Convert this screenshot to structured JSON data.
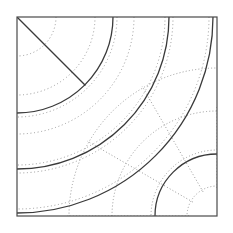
{
  "figure": {
    "title": "Concentric arc geometric construction",
    "background_color": "#ffffff",
    "frame": {
      "name": "bounding-square",
      "x": 17,
      "y": 17,
      "width": 200,
      "height": 199,
      "stroke": "#4a4a4a",
      "stroke_width": 1.2,
      "fill": "none"
    },
    "colors": {
      "solid_stroke": "#3a3a3a",
      "dotted_stroke": "#9a9a9a",
      "frame_stroke": "#4a4a4a"
    },
    "stroke_widths": {
      "solid": 1.3,
      "dotted": 1.0,
      "frame": 1.2
    },
    "dash_patterns": {
      "dotted": "1,2.6",
      "dotted_fine": "1,2.2"
    },
    "centers": [
      {
        "name": "top-left-center",
        "x": 17,
        "y": 17
      },
      {
        "name": "bottom-right-center",
        "x": 217,
        "y": 216
      }
    ],
    "diagonal": {
      "name": "corner-diagonal",
      "x1": 17,
      "y1": 17,
      "x2": 85,
      "y2": 85,
      "stroke": "#3a3a3a",
      "stroke_width": 1.3,
      "angle_degrees": 45
    },
    "solid_arcs": [
      {
        "name": "solid-arc-outer",
        "cx": 17,
        "cy": 17,
        "r": 196,
        "stroke": "#3a3a3a"
      },
      {
        "name": "solid-arc-middle",
        "cx": 17,
        "cy": 17,
        "r": 152,
        "stroke": "#3a3a3a"
      },
      {
        "name": "solid-arc-inner",
        "cx": 17,
        "cy": 17,
        "r": 96,
        "stroke": "#3a3a3a"
      }
    ],
    "solid_arcs_bottom_right": [
      {
        "name": "solid-arc-br",
        "cx": 217,
        "cy": 216,
        "r": 62,
        "stroke": "#3a3a3a"
      }
    ],
    "dotted_arcs_top_left": [
      {
        "name": "dotted-arc-tl-1",
        "cx": 17,
        "cy": 17,
        "r": 39
      },
      {
        "name": "dotted-arc-tl-2",
        "cx": 17,
        "cy": 17,
        "r": 78
      },
      {
        "name": "dotted-arc-tl-3",
        "cx": 17,
        "cy": 17,
        "r": 117
      },
      {
        "name": "dotted-arc-tl-4",
        "cx": 17,
        "cy": 17,
        "r": 156
      },
      {
        "name": "dotted-arc-tl-5",
        "cx": 17,
        "cy": 17,
        "r": 192
      },
      {
        "name": "dotted-arc-tl-6",
        "cx": 17,
        "cy": 17,
        "r": 100
      },
      {
        "name": "dotted-arc-tl-7",
        "cx": 17,
        "cy": 17,
        "r": 148
      }
    ],
    "dotted_arcs_bottom_right": [
      {
        "name": "dotted-arc-br-1",
        "cx": 217,
        "cy": 216,
        "r": 30
      },
      {
        "name": "dotted-arc-br-2",
        "cx": 217,
        "cy": 216,
        "r": 66
      },
      {
        "name": "dotted-arc-br-3",
        "cx": 217,
        "cy": 216,
        "r": 105
      },
      {
        "name": "dotted-arc-br-4",
        "cx": 217,
        "cy": 216,
        "r": 148
      }
    ],
    "dotted_radials": [
      {
        "name": "dotted-radial-1",
        "cx": 217,
        "cy": 216,
        "angle_degrees": 180,
        "r_inner": 28,
        "r_outer": 150
      },
      {
        "name": "dotted-radial-2",
        "cx": 217,
        "cy": 216,
        "angle_degrees": 210,
        "r_inner": 28,
        "r_outer": 150
      },
      {
        "name": "dotted-radial-3",
        "cx": 217,
        "cy": 216,
        "angle_degrees": 240,
        "r_inner": 28,
        "r_outer": 150
      },
      {
        "name": "dotted-radial-4",
        "cx": 217,
        "cy": 216,
        "angle_degrees": 270,
        "r_inner": 28,
        "r_outer": 110
      }
    ],
    "intersections": {
      "bottom_edge_x": [
        27,
        75,
        158
      ],
      "right_edge_y": [
        27,
        72,
        155
      ],
      "diagonal_end": {
        "x": 85,
        "y": 85
      }
    }
  }
}
